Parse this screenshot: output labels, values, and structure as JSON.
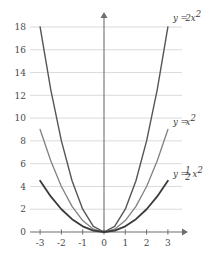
{
  "chart_data": {
    "type": "line",
    "title": "",
    "xlabel": "",
    "ylabel": "",
    "xlim": [
      -3.4,
      3.6
    ],
    "ylim": [
      0,
      18.8
    ],
    "grid": true,
    "grid_axis": "y",
    "legend_position": "inline-right-of-curve",
    "x_ticks": [
      "-3",
      "-2",
      "-1",
      "0",
      "1",
      "2",
      "3"
    ],
    "x_tick_values": [
      -3,
      -2,
      -1,
      0,
      1,
      2,
      3
    ],
    "y_ticks": [
      "0",
      "2",
      "4",
      "6",
      "8",
      "10",
      "12",
      "14",
      "16",
      "18"
    ],
    "y_tick_values": [
      0,
      2,
      4,
      6,
      8,
      10,
      12,
      14,
      16,
      18
    ],
    "x": [
      -3,
      -2.5,
      -2,
      -1.5,
      -1,
      -0.5,
      0,
      0.5,
      1,
      1.5,
      2,
      2.5,
      3
    ],
    "series": [
      {
        "name": "y = 2x^2",
        "label": "y = 2x²",
        "label_parts": {
          "lhs": "y =",
          "coef": "2",
          "var": "x",
          "exp": "2"
        },
        "color": "#555555",
        "width": 1.4,
        "values": [
          18,
          12.5,
          8,
          4.5,
          2,
          0.5,
          0,
          0.5,
          2,
          4.5,
          8,
          12.5,
          18
        ],
        "label_x": 3.05,
        "label_y": 18.55
      },
      {
        "name": "y = x^2",
        "label": "y = x²",
        "label_parts": {
          "lhs": "y =",
          "coef": "",
          "var": "x",
          "exp": "2"
        },
        "color": "#808080",
        "width": 1.3,
        "values": [
          9,
          6.25,
          4,
          2.25,
          1,
          0.25,
          0,
          0.25,
          1,
          2.25,
          4,
          6.25,
          9
        ],
        "label_x": 3.05,
        "label_y": 9.4
      },
      {
        "name": "y = 1/2 x^2",
        "label": "y = ½x²",
        "label_parts": {
          "lhs": "y =",
          "num": "1",
          "den": "2",
          "var": "x",
          "exp": "2"
        },
        "color": "#3a3a3a",
        "width": 1.8,
        "values": [
          4.5,
          3.125,
          2,
          1.125,
          0.5,
          0.125,
          0,
          0.125,
          0.5,
          1.125,
          2,
          3.125,
          4.5
        ],
        "label_x": 3.05,
        "label_y": 4.85
      }
    ],
    "axis_color": "#6e6e6e",
    "grid_color": "#d6d6d6",
    "tick_label_color": "#4a4a4a",
    "background": "#ffffff"
  },
  "axes": {
    "y_axis_name": "y-axis",
    "x_axis_name": "x-axis",
    "arrow_up": "▲",
    "arrow_right": "▶"
  }
}
